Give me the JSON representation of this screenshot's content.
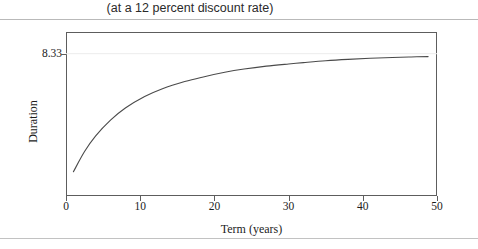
{
  "figure": {
    "title": "(at a 12 percent discount rate)",
    "y_axis_label_text": "Duration",
    "x_axis_label_text": "Term (years)"
  },
  "chart_data": {
    "type": "line",
    "title": "(at a 12 percent discount rate)",
    "xlabel": "Term (years)",
    "ylabel": "Duration",
    "xlim": [
      0,
      50
    ],
    "ylim": [
      0,
      9.6
    ],
    "xticks": [
      "0",
      "10",
      "20",
      "30",
      "40",
      "50"
    ],
    "xtick_values": [
      0,
      10,
      20,
      30,
      40,
      50
    ],
    "yticks": [
      "8.33"
    ],
    "ytick_values": [
      8.33
    ],
    "grid": false,
    "legend": null,
    "asymptote": 8.33,
    "series": [
      {
        "name": "Duration",
        "color": "#4a4a4a",
        "x": [
          1.0,
          2.5,
          4.0,
          6.0,
          8.0,
          10.6,
          13.0,
          16.0,
          18.5,
          21.4,
          24.0,
          27.0,
          30.0,
          32.0,
          35.0,
          38.0,
          41.0,
          44.0,
          46.5,
          48.8
        ],
        "y": [
          1.42,
          2.6,
          3.52,
          4.44,
          5.15,
          5.82,
          6.28,
          6.7,
          6.97,
          7.24,
          7.43,
          7.6,
          7.73,
          7.81,
          7.92,
          8.0,
          8.06,
          8.11,
          8.14,
          8.16
        ]
      }
    ]
  }
}
